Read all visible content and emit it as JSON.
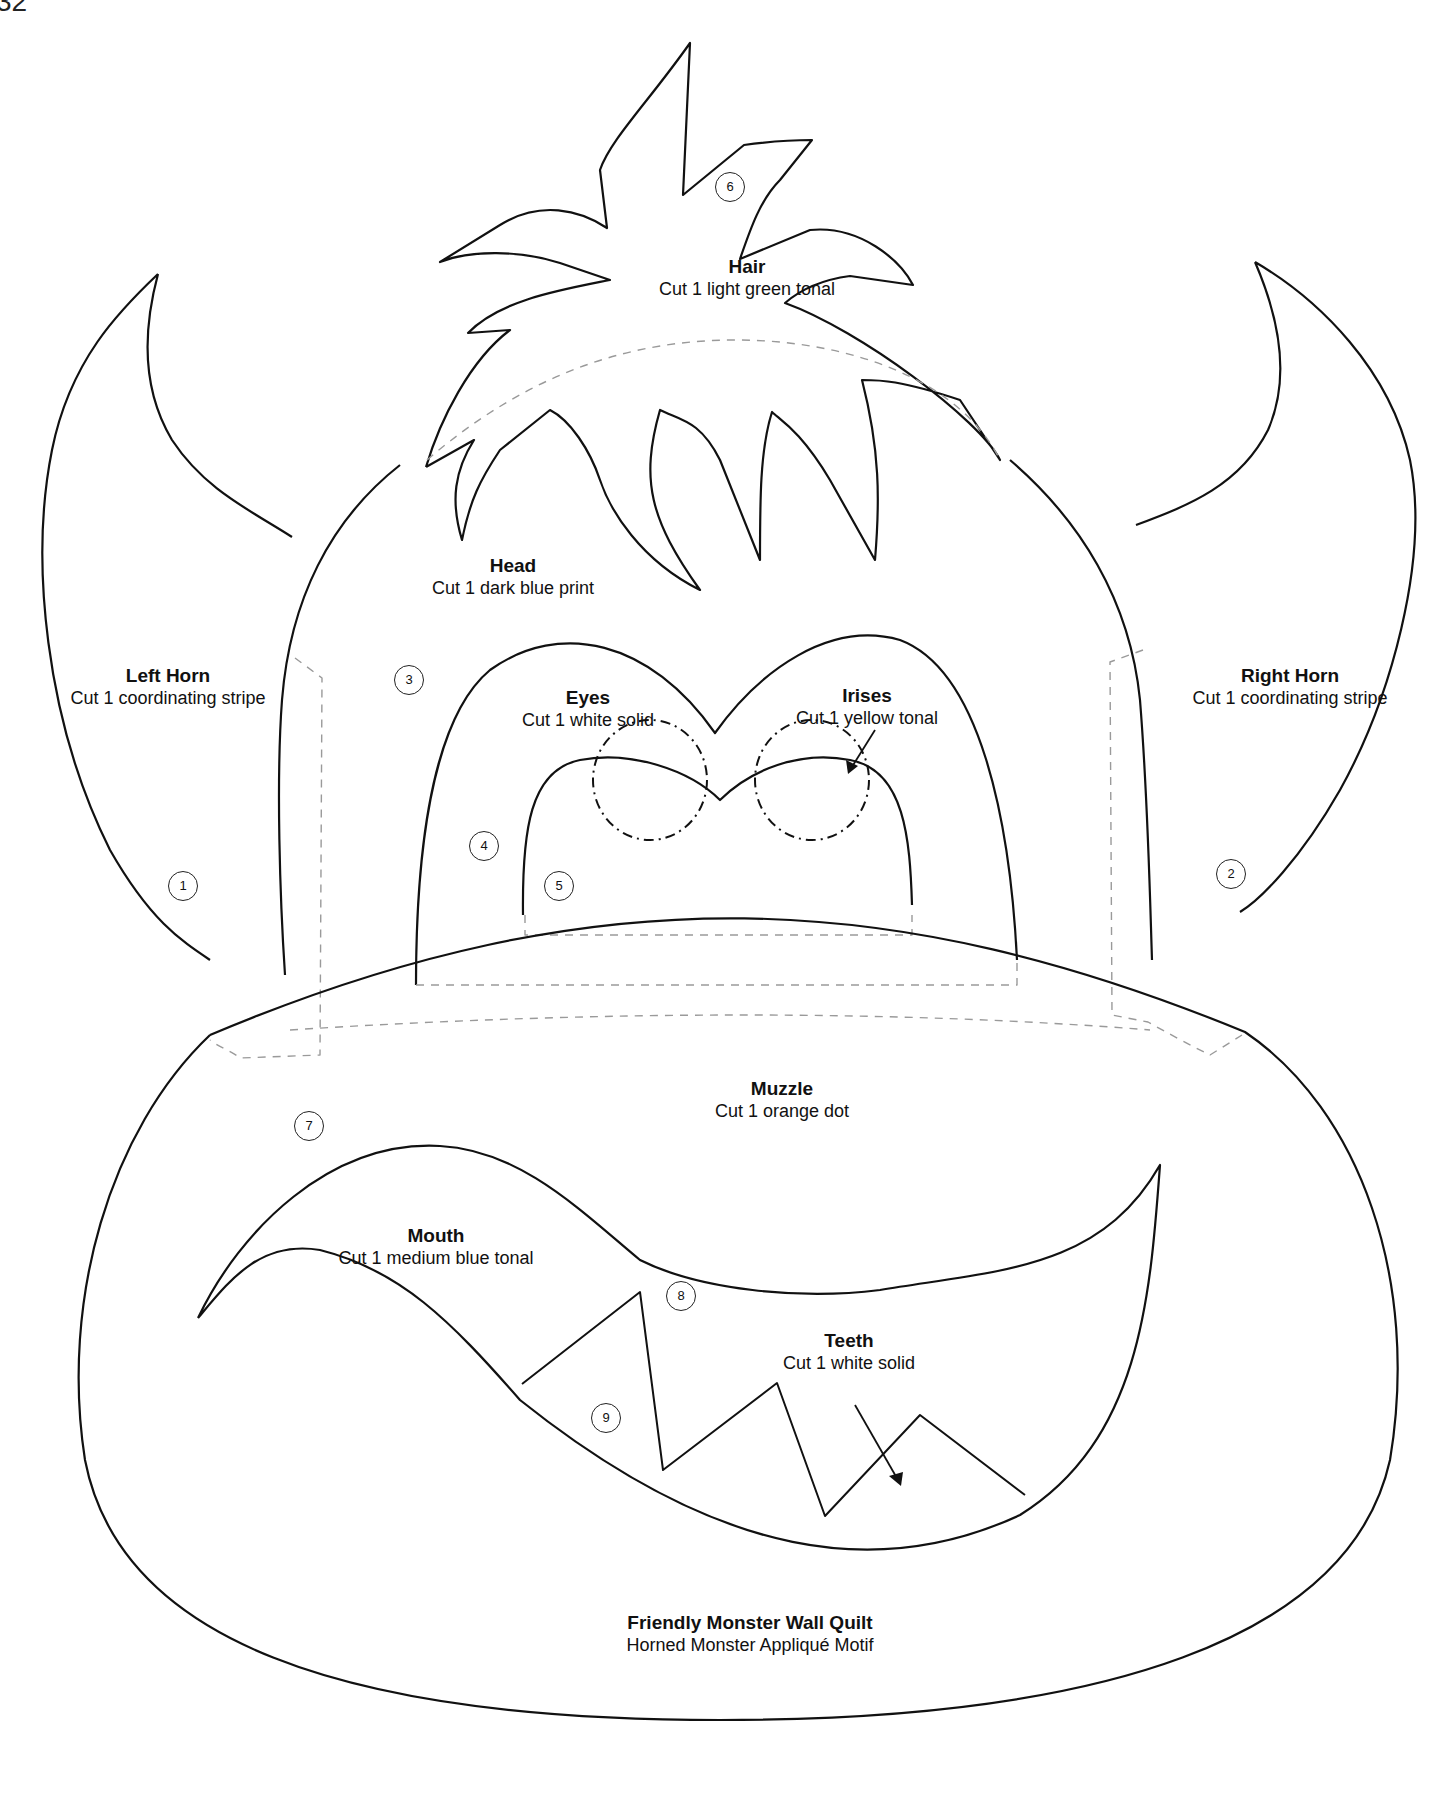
{
  "page": {
    "number": "32"
  },
  "pieces": [
    {
      "id": "left-horn",
      "title": "Left Horn",
      "instruction": "Cut 1 coordinating stripe",
      "number": "1"
    },
    {
      "id": "right-horn",
      "title": "Right Horn",
      "instruction": "Cut 1 coordinating stripe",
      "number": "2"
    },
    {
      "id": "head",
      "title": "Head",
      "instruction": "Cut 1 dark blue print",
      "number": "3"
    },
    {
      "id": "eyes",
      "title": "Eyes",
      "instruction": "Cut 1 white solid",
      "number": "4"
    },
    {
      "id": "irises",
      "title": "Irises",
      "instruction": "Cut 1 yellow tonal",
      "number": "5"
    },
    {
      "id": "hair",
      "title": "Hair",
      "instruction": "Cut 1 light green tonal",
      "number": "6"
    },
    {
      "id": "muzzle",
      "title": "Muzzle",
      "instruction": "Cut 1 orange dot",
      "number": "7"
    },
    {
      "id": "mouth",
      "title": "Mouth",
      "instruction": "Cut 1 medium blue tonal",
      "number": "8"
    },
    {
      "id": "teeth",
      "title": "Teeth",
      "instruction": "Cut 1 white solid",
      "number": "9"
    }
  ],
  "caption": {
    "title": "Friendly Monster Wall Quilt",
    "subtitle": "Horned Monster Appliqué Motif"
  },
  "colors": {
    "line": "#111111",
    "dashed": "#9a9a9a",
    "background": "#ffffff"
  }
}
